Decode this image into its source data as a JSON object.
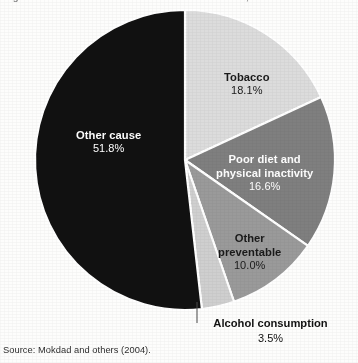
{
  "figure": {
    "title": "Figure 1. Actual causes of death in the United States, 2000",
    "title_truncated": true,
    "source": "Source: Mokdad and others (2004).",
    "background_color": "#fdfdfc"
  },
  "chart_data": {
    "type": "pie",
    "title": "Figure 1. Actual causes of death in the United States, 2000",
    "xlabel": "",
    "ylabel": "",
    "unit": "%",
    "start_angle_deg": 0,
    "direction": "clockwise",
    "categories": [
      "Tobacco",
      "Poor diet and physical inactivity",
      "Other preventable",
      "Alcohol consumption",
      "Other cause"
    ],
    "values": [
      18.1,
      16.6,
      10.0,
      3.5,
      51.8
    ],
    "total": 100.0,
    "slices": [
      {
        "label": "Tobacco",
        "label_line1": "Tobacco",
        "value": 18.1,
        "value_text": "18.1%",
        "color": "#dcdcdc",
        "text_color": "#1a1a1a",
        "start_deg": 0,
        "end_deg": 65.16
      },
      {
        "label": "Poor diet and physical inactivity",
        "label_line1": "Poor diet and",
        "label_line2": "physical inactivity",
        "value": 16.6,
        "value_text": "16.6%",
        "color": "#7f7f7f",
        "text_color": "#ffffff",
        "start_deg": 65.16,
        "end_deg": 124.92
      },
      {
        "label": "Other preventable",
        "label_line1": "Other",
        "label_line2": "preventable",
        "value": 10.0,
        "value_text": "10.0%",
        "color": "#9a9a9a",
        "text_color": "#1a1a1a",
        "start_deg": 124.92,
        "end_deg": 160.92
      },
      {
        "label": "Alcohol consumption",
        "label_line1": "Alcohol consumption",
        "value": 3.5,
        "value_text": "3.5%",
        "color": "#cfcfcf",
        "text_color": "#111111",
        "start_deg": 160.92,
        "end_deg": 173.52,
        "callout": true
      },
      {
        "label": "Other cause",
        "label_line1": "Other cause",
        "value": 51.8,
        "value_text": "51.8%",
        "color": "#111111",
        "text_color": "#ffffff",
        "start_deg": 173.52,
        "end_deg": 360
      }
    ],
    "legend": "none",
    "grid": false,
    "separator_color": "#ffffff"
  }
}
